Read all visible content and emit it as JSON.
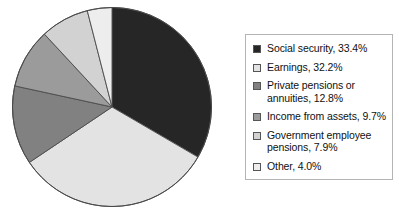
{
  "chart_data": {
    "type": "pie",
    "title": "",
    "subtitle": "",
    "xlabel": "",
    "ylabel": "",
    "grid": false,
    "legend_position": "right",
    "start_angle_deg": 0,
    "direction": "clockwise",
    "units": "percent",
    "categories": [
      "Social security",
      "Earnings",
      "Private pensions or annuities",
      "Income from assets",
      "Government employee pensions",
      "Other"
    ],
    "values": [
      33.4,
      32.2,
      12.8,
      9.7,
      7.9,
      4.0
    ],
    "colors": [
      "#262626",
      "#e3e3e3",
      "#818181",
      "#9b9b9b",
      "#d2d2d2",
      "#ededed"
    ],
    "slice_border_color": "#4a4a4a",
    "slices": [
      {
        "label": "Social security",
        "value": 33.4,
        "color": "#262626"
      },
      {
        "label": "Earnings",
        "value": 32.2,
        "color": "#e3e3e3"
      },
      {
        "label": "Private pensions or annuities",
        "value": 12.8,
        "color": "#818181"
      },
      {
        "label": "Income from assets",
        "value": 9.7,
        "color": "#9b9b9b"
      },
      {
        "label": "Government employee pensions",
        "value": 7.9,
        "color": "#d2d2d2"
      },
      {
        "label": "Other",
        "value": 4.0,
        "color": "#ededed"
      }
    ]
  },
  "legend": {
    "items": [
      {
        "label": "Social security, 33.4%",
        "swatch_name": "legend-swatch-social-security",
        "color": "#262626"
      },
      {
        "label": "Earnings, 32.2%",
        "swatch_name": "legend-swatch-earnings",
        "color": "#e3e3e3"
      },
      {
        "label": "Private pensions or\nannuities, 12.8%",
        "swatch_name": "legend-swatch-private-pensions-or-annuities",
        "color": "#818181"
      },
      {
        "label": "Income from assets, 9.7%",
        "swatch_name": "legend-swatch-income-from-assets",
        "color": "#9b9b9b"
      },
      {
        "label": "Government employee\npensions, 7.9%",
        "swatch_name": "legend-swatch-government-employee-pensions",
        "color": "#d2d2d2"
      },
      {
        "label": "Other, 4.0%",
        "swatch_name": "legend-swatch-other",
        "color": "#ededed"
      }
    ]
  }
}
